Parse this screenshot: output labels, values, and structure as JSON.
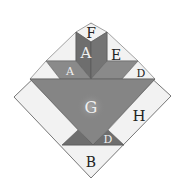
{
  "diagram": {
    "colors": {
      "light": "#f2f2f2",
      "medium": "#8c8c8c",
      "dark": "#6e6e6e",
      "darker": "#5f5f5f",
      "outline": "#555555",
      "label_dark": "#222222",
      "label_light": "#f0f0f0"
    },
    "labels": {
      "F": "F",
      "A_top": "A",
      "A_left": "A",
      "E": "E",
      "D_right": "D",
      "G": "G",
      "H": "H",
      "D_bottom": "D",
      "B": "B"
    }
  }
}
